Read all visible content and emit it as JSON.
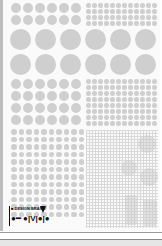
{
  "cover": {
    "background": "#fafafa",
    "dot_color": "#cfcfcf",
    "logo": {
      "line1": "■ DESIGN BRAND",
      "line2": "●━ ●|V|●|●"
    }
  },
  "sections": [
    {
      "name": "top-left-medium-dots",
      "cols": 6,
      "rows": 2
    },
    {
      "name": "top-right-small-dots",
      "cols": 12,
      "rows": 4
    },
    {
      "name": "large-dots",
      "cols": 6,
      "rows": 2
    },
    {
      "name": "mid-left-medium-dots",
      "cols": 6,
      "rows": 4
    },
    {
      "name": "mid-right-small-dots",
      "cols": 12,
      "rows": 8
    },
    {
      "name": "lower-left-small-dots",
      "cols": 10,
      "rows": 12
    },
    {
      "name": "lower-right-fine-grid",
      "cols": 0,
      "rows": 0
    }
  ]
}
